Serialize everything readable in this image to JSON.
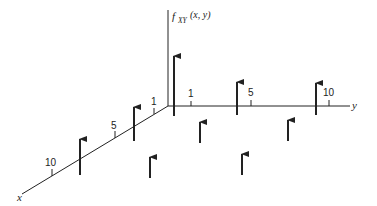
{
  "diagram": {
    "title_label": "f",
    "title_subscript": "XY",
    "title_args": "(x, y)",
    "axes": {
      "x_label": "x",
      "y_label": "y"
    },
    "y_ticks": [
      {
        "label": "1"
      },
      {
        "label": "5"
      },
      {
        "label": "10"
      }
    ],
    "x_ticks": [
      {
        "label": "1"
      },
      {
        "label": "5"
      },
      {
        "label": "10"
      }
    ],
    "colors": {
      "ink": "#222222",
      "background": "#ffffff"
    },
    "impulses": [
      {
        "name": "origin-impulse",
        "height": "tall"
      },
      {
        "name": "y-axis-impulse-1",
        "height": "medium"
      },
      {
        "name": "y-axis-impulse-2",
        "height": "medium"
      },
      {
        "name": "x-axis-impulse-1",
        "height": "medium"
      },
      {
        "name": "x-axis-impulse-2",
        "height": "medium"
      },
      {
        "name": "plane-impulse-1",
        "height": "short"
      },
      {
        "name": "plane-impulse-2",
        "height": "short"
      },
      {
        "name": "plane-impulse-3",
        "height": "short"
      },
      {
        "name": "plane-impulse-4",
        "height": "short"
      }
    ]
  }
}
